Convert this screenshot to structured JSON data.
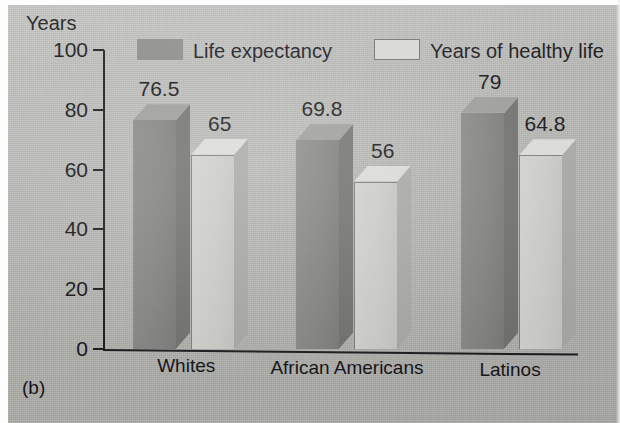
{
  "figure": {
    "panel_label": "(b)",
    "axis_unit_label": "Years"
  },
  "chart_data": {
    "type": "bar",
    "title": "",
    "subtitle": "",
    "xlabel": "",
    "ylabel": "Years",
    "ylim": [
      0,
      100
    ],
    "ytick_values": [
      100,
      80,
      60,
      40,
      20,
      0
    ],
    "ytick_labels": [
      "100",
      "80",
      "60",
      "40",
      "20",
      "0"
    ],
    "grid": false,
    "legend_position": "top-center",
    "style": "3d-column",
    "categories": [
      "Whites",
      "African Americans",
      "Latinos"
    ],
    "series": [
      {
        "name": "Life expectancy",
        "color": "#8a8a88",
        "values": [
          76.5,
          69.8,
          79
        ],
        "value_labels": [
          "76.5",
          "69.8",
          "79"
        ]
      },
      {
        "name": "Years of healthy life",
        "color": "#d6d6d3",
        "values": [
          65,
          56,
          64.8
        ],
        "value_labels": [
          "65",
          "56",
          "64.8"
        ]
      }
    ]
  }
}
